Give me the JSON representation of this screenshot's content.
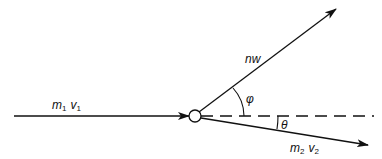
{
  "diagram": {
    "type": "collision-vector-diagram",
    "colors": {
      "stroke": "#111111",
      "background": "#ffffff"
    },
    "incoming": {
      "label_main": "m",
      "label_sub": "1",
      "label_main2": "v",
      "label_sub2": "1"
    },
    "photon": {
      "label": "nw"
    },
    "outgoing": {
      "label_main": "m",
      "label_sub": "2",
      "label_main2": "v",
      "label_sub2": "2"
    },
    "angles": {
      "phi": "φ",
      "theta": "θ"
    },
    "reference_line": "dashed-horizontal"
  }
}
